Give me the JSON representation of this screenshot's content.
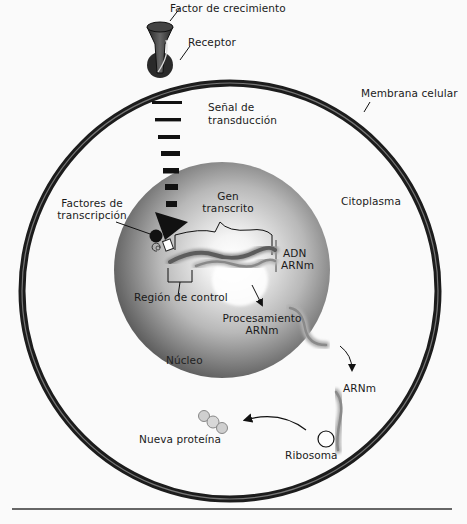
{
  "diagram": {
    "title": "",
    "labels": {
      "growth_factor": "Factor de crecimiento",
      "receptor": "Receptor",
      "cell_membrane": "Membrana celular",
      "signal_transduction_1": "Señal de",
      "signal_transduction_2": "transducción",
      "transcription_factors_1": "Factores de",
      "transcription_factors_2": "transcripción",
      "transcribed_gene_1": "Gen",
      "transcribed_gene_2": "transcrito",
      "dna": "ADN",
      "mrna_nucleus": "ARNm",
      "cytoplasm": "Citoplasma",
      "control_region": "Región de control",
      "processing_1": "Procesamiento",
      "processing_2": "ARNm",
      "nucleus": "Núcleo",
      "mrna_cytoplasm": "ARNm",
      "ribosome": "Ribosoma",
      "new_protein": "Nueva proteína"
    },
    "colors": {
      "membrane": "#2b2b2b",
      "nucleus_light": "#e8e8e8",
      "nucleus_dark": "#555555",
      "dna_strand": "#6e6e6e",
      "mrna_strand": "#a0a0a0",
      "background": "#fafafa"
    }
  }
}
